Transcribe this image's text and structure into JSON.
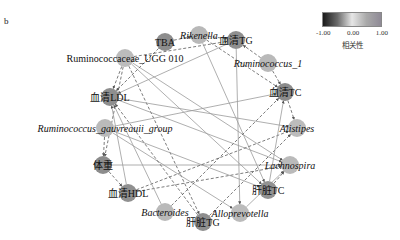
{
  "panel_label": "b",
  "legend": {
    "title": "相关性",
    "ticks": [
      "-1.00",
      "0.00",
      "1.00"
    ],
    "colors": {
      "neg": "#1a1a1a",
      "mid": "#e6e6e6",
      "pos": "#8f8a96"
    }
  },
  "nodes": [
    {
      "id": "TBA",
      "label": "TBA",
      "italic": false,
      "x": 165,
      "y": 42,
      "fill": "#8d8d8d"
    },
    {
      "id": "Rikenella",
      "label": "Rikenella",
      "italic": true,
      "x": 199,
      "y": 35,
      "fill": "#b8b8b8"
    },
    {
      "id": "serumTG",
      "label": "血清TG",
      "italic": false,
      "x": 236,
      "y": 40,
      "fill": "#8f8f8f"
    },
    {
      "id": "Rum1",
      "label": "Ruminococcus_1",
      "italic": true,
      "x": 268,
      "y": 63,
      "fill": "#b9b9b9"
    },
    {
      "id": "serumTC",
      "label": "血清TC",
      "italic": false,
      "x": 285,
      "y": 92,
      "fill": "#8b8b8b"
    },
    {
      "id": "Alistipes",
      "label": "Alistipes",
      "italic": true,
      "x": 297,
      "y": 128,
      "fill": "#bcbcbc"
    },
    {
      "id": "Lachnospira",
      "label": "Lachnospira",
      "italic": true,
      "x": 290,
      "y": 165,
      "fill": "#bababa"
    },
    {
      "id": "liverTC",
      "label": "肝脏TC",
      "italic": false,
      "x": 268,
      "y": 190,
      "fill": "#929292"
    },
    {
      "id": "Alloprevotella",
      "label": "Alloprevotella",
      "italic": true,
      "x": 240,
      "y": 213,
      "fill": "#bbbbbb"
    },
    {
      "id": "liverTG",
      "label": "肝脏TG",
      "italic": false,
      "x": 203,
      "y": 222,
      "fill": "#8e8e8e"
    },
    {
      "id": "Bacteroides",
      "label": "Bacteroides",
      "italic": true,
      "x": 165,
      "y": 212,
      "fill": "#b9b9b9"
    },
    {
      "id": "serumHDL",
      "label": "血清HDL",
      "italic": false,
      "x": 128,
      "y": 193,
      "fill": "#909090"
    },
    {
      "id": "weight",
      "label": "体重",
      "italic": false,
      "x": 103,
      "y": 165,
      "fill": "#8c8c8c"
    },
    {
      "id": "Rgauv",
      "label": "Ruminococcus_gauvreauii_group",
      "italic": true,
      "x": 105,
      "y": 128,
      "fill": "#bababa"
    },
    {
      "id": "serumLDL",
      "label": "血清LDL",
      "italic": false,
      "x": 110,
      "y": 97,
      "fill": "#8e8e8e"
    },
    {
      "id": "RUGG010",
      "label": "Ruminococcaceae_UGG 010",
      "italic": false,
      "x": 125,
      "y": 58,
      "fill": "#bcbcbc"
    }
  ],
  "edges": [
    {
      "s": "TBA",
      "t": "Rikenella",
      "style": "dashed"
    },
    {
      "s": "Rikenella",
      "t": "serumTG",
      "style": "dashed"
    },
    {
      "s": "Rikenella",
      "t": "serumTC",
      "style": "dashed"
    },
    {
      "s": "Rum1",
      "t": "serumTG",
      "style": "dashed"
    },
    {
      "s": "Rum1",
      "t": "serumTC",
      "style": "dashed"
    },
    {
      "s": "RUGG010",
      "t": "serumTG",
      "style": "dashed"
    },
    {
      "s": "RUGG010",
      "t": "serumLDL",
      "style": "dashed"
    },
    {
      "s": "RUGG010",
      "t": "weight",
      "style": "dashed"
    },
    {
      "s": "RUGG010",
      "t": "liverTG",
      "style": "dashed"
    },
    {
      "s": "RUGG010",
      "t": "liverTC",
      "style": "solid"
    },
    {
      "s": "RUGG010",
      "t": "Lachnospira",
      "style": "solid"
    },
    {
      "s": "TBA",
      "t": "serumLDL",
      "style": "dashed"
    },
    {
      "s": "serumTG",
      "t": "Alloprevotella",
      "style": "solid"
    },
    {
      "s": "serumTG",
      "t": "serumLDL",
      "style": "solid"
    },
    {
      "s": "Rikenella",
      "t": "liverTC",
      "style": "solid"
    },
    {
      "s": "serumLDL",
      "t": "Alistipes",
      "style": "solid"
    },
    {
      "s": "serumLDL",
      "t": "Lachnospira",
      "style": "solid"
    },
    {
      "s": "Rgauv",
      "t": "serumTC",
      "style": "solid"
    },
    {
      "s": "Rgauv",
      "t": "Alloprevotella",
      "style": "solid"
    },
    {
      "s": "Rgauv",
      "t": "weight",
      "style": "dashed"
    },
    {
      "s": "Rgauv",
      "t": "liverTC",
      "style": "solid"
    },
    {
      "s": "weight",
      "t": "Lachnospira",
      "style": "solid"
    },
    {
      "s": "weight",
      "t": "serumHDL",
      "style": "dashed"
    },
    {
      "s": "serumHDL",
      "t": "Alistipes",
      "style": "dashed"
    },
    {
      "s": "serumHDL",
      "t": "serumLDL",
      "style": "solid"
    },
    {
      "s": "serumHDL",
      "t": "Lachnospira",
      "style": "dashed"
    },
    {
      "s": "Bacteroides",
      "t": "serumTC",
      "style": "dashed"
    },
    {
      "s": "Bacteroides",
      "t": "serumLDL",
      "style": "solid"
    },
    {
      "s": "liverTG",
      "t": "Alistipes",
      "style": "dashed"
    },
    {
      "s": "liverTG",
      "t": "serumLDL",
      "style": "dashed"
    },
    {
      "s": "Alloprevotella",
      "t": "Lachnospira",
      "style": "solid"
    },
    {
      "s": "liverTC",
      "t": "serumTC",
      "style": "solid"
    },
    {
      "s": "liverTC",
      "t": "Lachnospira",
      "style": "dashed"
    },
    {
      "s": "serumTC",
      "t": "Alistipes",
      "style": "dashed"
    }
  ]
}
